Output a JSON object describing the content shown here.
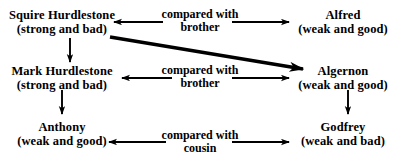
{
  "diagram": {
    "ink_color": "#000000",
    "background_color": "#ffffff",
    "nodes": [
      {
        "id": "squire",
        "name": "Squire Hurdlestone",
        "trait": "(strong and bad)"
      },
      {
        "id": "alfred",
        "name": "Alfred",
        "trait": "(weak and good)"
      },
      {
        "id": "mark",
        "name": "Mark Hurdlestone",
        "trait": "(strong and bad)"
      },
      {
        "id": "algernon",
        "name": "Algernon",
        "trait": "(weak and good)"
      },
      {
        "id": "anthony",
        "name": "Anthony",
        "trait": "(weak and good)"
      },
      {
        "id": "godfrey",
        "name": "Godfrey",
        "trait": "(weak and bad)"
      }
    ],
    "edge_labels": [
      {
        "id": "brother-top",
        "line1": "compared with",
        "line2": "brother"
      },
      {
        "id": "brother-mid",
        "line1": "compared with",
        "line2": "brother"
      },
      {
        "id": "cousin",
        "line1": "compared with",
        "line2": "cousin"
      }
    ],
    "connections": [
      {
        "id": "squire-alfred",
        "from": "Squire Hurdlestone",
        "to": "Alfred",
        "relation": "compared with brother",
        "style": "double-headed-horizontal"
      },
      {
        "id": "mark-algernon",
        "from": "Mark Hurdlestone",
        "to": "Algernon",
        "relation": "compared with brother",
        "style": "double-headed-horizontal"
      },
      {
        "id": "anthony-godfrey",
        "from": "Anthony",
        "to": "Godfrey",
        "relation": "compared with cousin",
        "style": "double-headed-horizontal"
      },
      {
        "id": "squire-mark",
        "from": "Squire Hurdlestone",
        "to": "Mark Hurdlestone",
        "relation": "father to son",
        "style": "vertical-arrow-down"
      },
      {
        "id": "mark-anthony",
        "from": "Mark Hurdlestone",
        "to": "Anthony",
        "relation": "father to son",
        "style": "vertical-arrow-down"
      },
      {
        "id": "algernon-godfrey",
        "from": "Algernon",
        "to": "Godfrey",
        "relation": "father to son",
        "style": "vertical-arrow-down"
      },
      {
        "id": "squire-algernon",
        "from": "Squire Hurdlestone",
        "to": "Algernon",
        "relation": "cross comparison",
        "style": "thick-diagonal-arrow"
      }
    ]
  }
}
